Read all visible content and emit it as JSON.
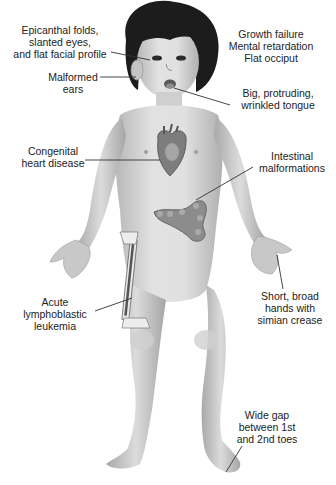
{
  "diagram": {
    "colors": {
      "background": "#ffffff",
      "skin": "#d9d9d9",
      "skin_shadow": "#a8a8a8",
      "hair": "#1c1c1c",
      "organ": "#8a8a8a",
      "leader_line": "#333333",
      "text": "#222222"
    },
    "labels": [
      {
        "id": "eyes",
        "lines": [
          "Epicanthal folds,",
          "slanted eyes,",
          "and flat facial profile"
        ]
      },
      {
        "id": "ears",
        "lines": [
          "Malformed",
          "ears"
        ]
      },
      {
        "id": "general",
        "lines": [
          "Growth failure",
          "Mental retardation",
          "Flat occiput"
        ]
      },
      {
        "id": "tongue",
        "lines": [
          "Big, protruding,",
          "wrinkled tongue"
        ]
      },
      {
        "id": "heart",
        "lines": [
          "Congenital",
          "heart disease"
        ]
      },
      {
        "id": "intestine",
        "lines": [
          "Intestinal",
          "malformations"
        ]
      },
      {
        "id": "hands",
        "lines": [
          "Short, broad",
          "hands with",
          "simian crease"
        ]
      },
      {
        "id": "leukemia",
        "lines": [
          "Acute",
          "lymphoblastic",
          "leukemia"
        ]
      },
      {
        "id": "toes",
        "lines": [
          "Wide gap",
          "between 1st",
          "and 2nd toes"
        ]
      }
    ]
  }
}
